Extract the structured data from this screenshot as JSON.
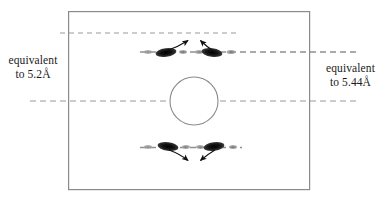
{
  "figure": {
    "type": "diffraction-pattern-diagram",
    "background_color": "#ffffff",
    "frame": {
      "name": "image-frame",
      "x": 68,
      "y": 11,
      "width": 242,
      "height": 179,
      "stroke_color": "#8a8a8a",
      "stroke_width": 1.2
    },
    "annotations": {
      "left": {
        "line1": "equivalent",
        "line2": "to 5.2Å",
        "value": "5.2",
        "unit": "Å"
      },
      "right": {
        "line1": "equivalent",
        "line2": "to 5.44Å",
        "value": "5.44",
        "unit": "Å"
      }
    },
    "layer_lines": [
      {
        "name": "upper-guide-line",
        "y": 33,
        "x1": 60,
        "x2": 240,
        "color": "#9a9a9a",
        "dash": "5,4",
        "width": 1.1,
        "role": "5.2A-reference"
      },
      {
        "name": "upper-layer-line",
        "y": 52,
        "x1": 140,
        "x2": 355,
        "color": "#8f8f8f",
        "dash": "6,4",
        "width": 1.3,
        "role": "5.44A-reference"
      },
      {
        "name": "equator-line",
        "y": 101,
        "x1": 30,
        "x2": 357,
        "color": "#9a9a9a",
        "dash": "6,4",
        "width": 1.2,
        "role": "equator"
      },
      {
        "name": "lower-layer-line",
        "y": 148,
        "x1": 140,
        "x2": 240,
        "color": "#8f8f8f",
        "dash": "6,4",
        "width": 1.3,
        "role": "mirror-of-upper-layer-line"
      }
    ],
    "beam_stop": {
      "name": "beam-stop-circle",
      "cx": 194,
      "cy": 101,
      "r": 24,
      "stroke_color": "#8a8a8a",
      "stroke_width": 1.1,
      "fill": "none"
    },
    "reflections": [
      {
        "name": "upper-left-reflection",
        "cx": 166,
        "cy": 52,
        "rx": 10.5,
        "ry": 4.0,
        "angle": -8,
        "color": "#171717"
      },
      {
        "name": "upper-right-reflection",
        "cx": 212,
        "cy": 52,
        "rx": 10.5,
        "ry": 4.0,
        "angle": 8,
        "color": "#171717"
      },
      {
        "name": "lower-left-reflection",
        "cx": 168,
        "cy": 147,
        "rx": 10.5,
        "ry": 4.0,
        "angle": 8,
        "color": "#171717"
      },
      {
        "name": "lower-right-reflection",
        "cx": 214,
        "cy": 147,
        "rx": 10.5,
        "ry": 4.0,
        "angle": -8,
        "color": "#171717"
      }
    ],
    "faint_spots": [
      {
        "name": "faint-spot-upper-outer-left",
        "cx": 148,
        "cy": 52,
        "rx": 4.0,
        "ry": 2.0
      },
      {
        "name": "faint-spot-upper-inner-left",
        "cx": 183,
        "cy": 52,
        "rx": 4.0,
        "ry": 2.0
      },
      {
        "name": "faint-spot-upper-inner-right",
        "cx": 199,
        "cy": 52,
        "rx": 4.0,
        "ry": 2.0
      },
      {
        "name": "faint-spot-upper-outer-right",
        "cx": 230,
        "cy": 52,
        "rx": 4.5,
        "ry": 2.0
      },
      {
        "name": "faint-spot-lower-outer-left",
        "cx": 148,
        "cy": 147,
        "rx": 4.0,
        "ry": 2.0
      },
      {
        "name": "faint-spot-lower-inner-left",
        "cx": 186,
        "cy": 147,
        "rx": 4.0,
        "ry": 2.0
      },
      {
        "name": "faint-spot-lower-inner-right",
        "cx": 200,
        "cy": 147,
        "rx": 4.0,
        "ry": 2.0
      },
      {
        "name": "faint-spot-lower-outer-right",
        "cx": 233,
        "cy": 147,
        "rx": 4.0,
        "ry": 2.0
      }
    ],
    "arrows": [
      {
        "name": "arrow-upper-left",
        "from": [
          168,
          50
        ],
        "to": [
          190,
          39
        ],
        "direction": "inward-up"
      },
      {
        "name": "arrow-upper-right",
        "from": [
          212,
          50
        ],
        "to": [
          198,
          39
        ],
        "direction": "inward-up"
      },
      {
        "name": "arrow-lower-left",
        "from": [
          170,
          150
        ],
        "to": [
          190,
          163
        ],
        "direction": "inward-down"
      },
      {
        "name": "arrow-lower-right",
        "from": [
          214,
          150
        ],
        "to": [
          199,
          163
        ],
        "direction": "inward-down"
      }
    ],
    "colors": {
      "reflection": "#171717",
      "faint": "#6e6e6e",
      "guide": "#9a9a9a",
      "frame": "#8a8a8a",
      "text": "#1a1a1a"
    }
  }
}
